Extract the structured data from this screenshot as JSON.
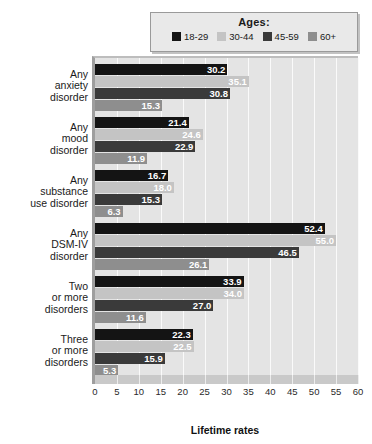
{
  "chart_data": {
    "type": "bar",
    "orientation": "horizontal",
    "title": "",
    "xlabel": "Lifetime rates",
    "ylabel": "",
    "xlim": [
      0,
      60
    ],
    "xticks": [
      0,
      5,
      10,
      15,
      20,
      25,
      30,
      35,
      40,
      45,
      50,
      55,
      60
    ],
    "grid": true,
    "legend_title": "Ages:",
    "legend_position": "top-right",
    "categories": [
      "Any anxiety disorder",
      "Any mood disorder",
      "Any substance use disorder",
      "Any DSM-IV disorder",
      "Two or more disorders",
      "Three or more disorders"
    ],
    "category_lines": [
      [
        "Any",
        "anxiety",
        "disorder"
      ],
      [
        "Any",
        "mood",
        "disorder"
      ],
      [
        "Any",
        "substance",
        "use disorder"
      ],
      [
        "Any",
        "DSM-IV",
        "disorder"
      ],
      [
        "Two",
        "or more",
        "disorders"
      ],
      [
        "Three",
        "or more",
        "disorders"
      ]
    ],
    "series": [
      {
        "name": "18-29",
        "color": "#141414",
        "label_color": "#ffffff",
        "values": [
          30.2,
          21.4,
          16.7,
          52.4,
          33.9,
          22.3
        ]
      },
      {
        "name": "30-44",
        "color": "#c4c4c4",
        "label_color": "#ffffff",
        "values": [
          35.1,
          24.6,
          18.0,
          55.0,
          34.0,
          22.5
        ]
      },
      {
        "name": "45-59",
        "color": "#3a3a3a",
        "label_color": "#ffffff",
        "values": [
          30.8,
          22.9,
          15.3,
          46.5,
          27.0,
          15.9
        ]
      },
      {
        "name": "60+",
        "color": "#8e8e8e",
        "label_color": "#ffffff",
        "values": [
          15.3,
          11.9,
          6.3,
          26.1,
          11.6,
          5.3
        ]
      }
    ],
    "value_labels": [
      [
        "30.2",
        "35.1",
        "30.8",
        "15.3"
      ],
      [
        "21.4",
        "24.6",
        "22.9",
        "11.9"
      ],
      [
        "16.7",
        "18.0",
        "15.3",
        "6.3"
      ],
      [
        "52.4",
        "55.0",
        "46.5",
        "26.1"
      ],
      [
        "33.9",
        "34.0",
        "27.0",
        "11.6"
      ],
      [
        "22.3",
        "22.5",
        "15.9",
        "5.3"
      ]
    ]
  },
  "legend": {
    "title": "Ages:",
    "items": [
      {
        "label": "18-29",
        "color": "#141414"
      },
      {
        "label": "30-44",
        "color": "#c4c4c4"
      },
      {
        "label": "45-59",
        "color": "#3a3a3a"
      },
      {
        "label": "60+",
        "color": "#8e8e8e"
      }
    ]
  },
  "colors": {
    "plot_background": "#e4e4e4",
    "gridline": "#fafafa",
    "axis": "#9e9e9e",
    "legend_background": "#e9e9e9",
    "legend_border": "#9a9a9a"
  }
}
